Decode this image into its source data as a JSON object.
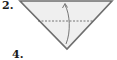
{
  "diagram": {
    "type": "origami-instructions",
    "steps": [
      {
        "label": "2."
      },
      {
        "label": "4."
      }
    ],
    "shape": {
      "kind": "triangle",
      "points": [
        [
          20,
          1
        ],
        [
          112,
          1
        ],
        [
          67,
          49
        ]
      ],
      "fill": "#efefef",
      "stroke": "#6e6e6e"
    },
    "fold_line": {
      "style": "dashed",
      "from": [
        38,
        21
      ],
      "to": [
        94,
        21
      ],
      "color": "#555555"
    },
    "arrow": {
      "direction": "up",
      "meaning": "fold bottom point up",
      "from": [
        66,
        44
      ],
      "to": [
        65,
        4
      ],
      "color": "#666666"
    }
  }
}
